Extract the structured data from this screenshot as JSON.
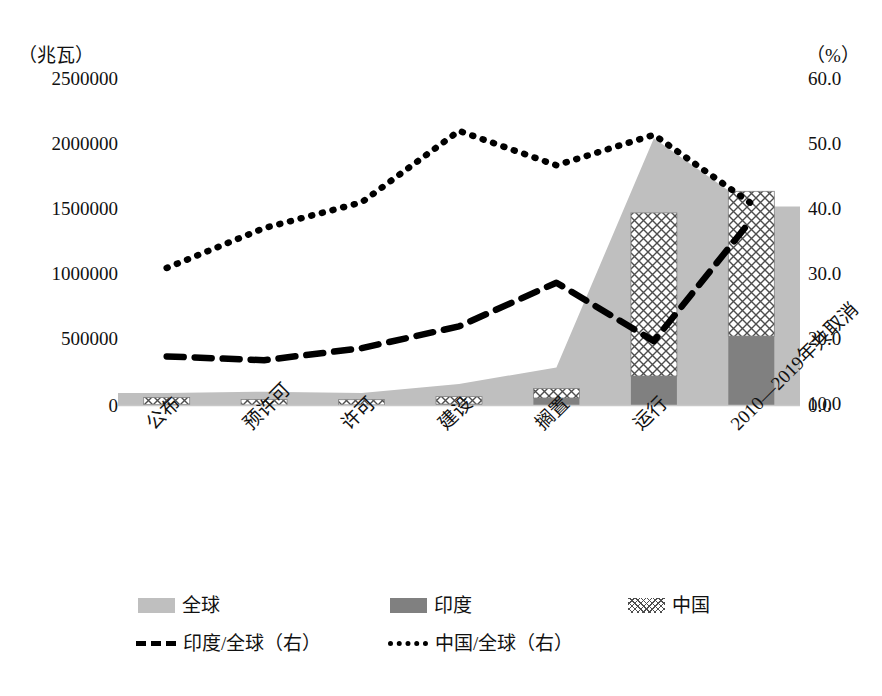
{
  "chart_data": {
    "type": "bar",
    "title": "",
    "categories": [
      "公布",
      "预许可",
      "许可",
      "建设",
      "搁置",
      "运行",
      "2010—2019年共取消"
    ],
    "left_axis": {
      "unit_label": "（兆瓦）",
      "ticks": [
        "0",
        "500000",
        "1000000",
        "1500000",
        "2000000",
        "2500000"
      ],
      "tick_values": [
        0,
        500000,
        1000000,
        1500000,
        2000000,
        2500000
      ],
      "ylim": [
        0,
        2500000
      ],
      "ylabel": "兆瓦"
    },
    "right_axis": {
      "unit_label": "（%）",
      "ticks": [
        "0.0",
        "10.0",
        "20.0",
        "30.0",
        "40.0",
        "50.0",
        "60.0"
      ],
      "tick_values": [
        0,
        10,
        20,
        30,
        40,
        50,
        60
      ],
      "ylim": [
        0,
        60
      ],
      "ylabel": "%"
    },
    "grid": false,
    "legend_position": "bottom",
    "series": [
      {
        "name": "全球",
        "key": "global",
        "type": "area",
        "axis": "left",
        "color": "#bfbfbf",
        "values": [
          95000,
          105000,
          95000,
          165000,
          290000,
          2040000,
          1520000
        ]
      },
      {
        "name": "印度",
        "key": "india",
        "type": "bar",
        "axis": "left",
        "color": "#808080",
        "values": [
          6000,
          4000,
          4000,
          11000,
          57000,
          225000,
          530000
        ]
      },
      {
        "name": "中国",
        "key": "china",
        "type": "bar",
        "axis": "left",
        "color": "crosshatch",
        "values": [
          55000,
          42000,
          40000,
          57000,
          72000,
          1245000,
          1105000
        ]
      },
      {
        "name": "印度/全球（右）",
        "key": "india_share",
        "type": "line",
        "style": "dashed",
        "axis": "right",
        "color": "#000000",
        "values": [
          9.0,
          8.3,
          10.5,
          14.5,
          22.5,
          11.8,
          34.0
        ]
      },
      {
        "name": "中国/全球（右）",
        "key": "china_share",
        "type": "line",
        "style": "dotted",
        "axis": "right",
        "color": "#000000",
        "values": [
          25.2,
          32.5,
          37.2,
          50.3,
          44.0,
          49.6,
          37.0
        ]
      }
    ]
  },
  "legend": {
    "items": [
      {
        "label": "全球",
        "marker": "area-swatch-light"
      },
      {
        "label": "印度",
        "marker": "bar-swatch-dark"
      },
      {
        "label": "中国",
        "marker": "bar-swatch-crosshatch"
      },
      {
        "label": "印度/全球（右）",
        "marker": "dashed-line"
      },
      {
        "label": "中国/全球（右）",
        "marker": "dotted-line"
      }
    ]
  }
}
